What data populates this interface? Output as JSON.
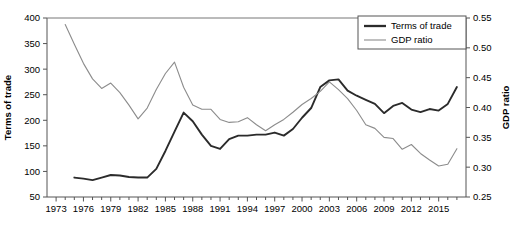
{
  "chart_data": {
    "type": "line",
    "title": "",
    "xlabel": "",
    "grid": false,
    "legend_position": "top-right",
    "x": [
      1973,
      1974,
      1975,
      1976,
      1977,
      1978,
      1979,
      1980,
      1981,
      1982,
      1983,
      1984,
      1985,
      1986,
      1987,
      1988,
      1989,
      1990,
      1991,
      1992,
      1993,
      1994,
      1995,
      1996,
      1997,
      1998,
      1999,
      2000,
      2001,
      2002,
      2003,
      2004,
      2005,
      2006,
      2007,
      2008,
      2009,
      2010,
      2011,
      2012,
      2013,
      2014,
      2015,
      2016,
      2017
    ],
    "xtick_labels": [
      "1973",
      "1976",
      "1979",
      "1982",
      "1985",
      "1988",
      "1991",
      "1994",
      "1997",
      "2000",
      "2003",
      "2006",
      "2009",
      "2012",
      "2015"
    ],
    "xtick_step_years": 3,
    "xlim": [
      1972,
      2018
    ],
    "axes": [
      {
        "id": "left",
        "label": "Terms of trade",
        "ticks": [
          50,
          100,
          150,
          200,
          250,
          300,
          350,
          400
        ],
        "ylim": [
          50,
          400
        ]
      },
      {
        "id": "right",
        "label": "GDP ratio",
        "ticks": [
          "0.25",
          "0.30",
          "0.35",
          "0.40",
          "0.45",
          "0.50",
          "0.55"
        ],
        "ylim": [
          0.25,
          0.55
        ]
      }
    ],
    "series": [
      {
        "name": "Terms of trade",
        "axis": "left",
        "color": "#2b2b2b",
        "width": 1.9,
        "x": [
          1975,
          1976,
          1977,
          1978,
          1979,
          1980,
          1981,
          1982,
          1983,
          1984,
          1985,
          1986,
          1987,
          1988,
          1989,
          1990,
          1991,
          1992,
          1993,
          1994,
          1995,
          1996,
          1997,
          1998,
          1999,
          2000,
          2001,
          2002,
          2003,
          2004,
          2005,
          2006,
          2007,
          2008,
          2009,
          2010,
          2011,
          2012,
          2013,
          2014,
          2015,
          2016,
          2017
        ],
        "values": [
          88,
          86,
          83,
          88,
          93,
          92,
          89,
          88,
          88,
          105,
          140,
          178,
          215,
          198,
          172,
          150,
          144,
          163,
          170,
          170,
          172,
          172,
          176,
          170,
          183,
          205,
          224,
          265,
          278,
          280,
          258,
          248,
          240,
          232,
          214,
          228,
          234,
          221,
          216,
          222,
          219,
          232,
          265
        ]
      },
      {
        "name": "GDP ratio",
        "axis": "right",
        "color": "#8c8c8c",
        "width": 1.1,
        "x": [
          1974,
          1975,
          1976,
          1977,
          1978,
          1979,
          1980,
          1981,
          1982,
          1983,
          1984,
          1985,
          1986,
          1987,
          1988,
          1989,
          1990,
          1991,
          1992,
          1993,
          1994,
          1995,
          1996,
          1997,
          1998,
          1999,
          2000,
          2001,
          2002,
          2003,
          2004,
          2005,
          2006,
          2007,
          2008,
          2009,
          2010,
          2011,
          2012,
          2013,
          2014,
          2015,
          2016,
          2017
        ],
        "values": [
          0.539,
          0.506,
          0.474,
          0.448,
          0.432,
          0.441,
          0.425,
          0.404,
          0.381,
          0.399,
          0.43,
          0.457,
          0.476,
          0.434,
          0.404,
          0.397,
          0.397,
          0.38,
          0.375,
          0.376,
          0.383,
          0.371,
          0.361,
          0.371,
          0.38,
          0.392,
          0.405,
          0.415,
          0.427,
          0.443,
          0.43,
          0.415,
          0.395,
          0.371,
          0.365,
          0.35,
          0.348,
          0.33,
          0.338,
          0.323,
          0.312,
          0.302,
          0.305,
          0.331
        ]
      }
    ]
  },
  "legend": {
    "entries": [
      {
        "label": "Terms of trade"
      },
      {
        "label": "GDP ratio"
      }
    ]
  }
}
